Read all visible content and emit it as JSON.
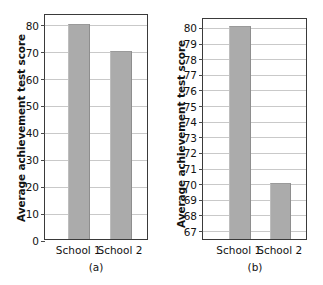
{
  "figure": {
    "panels": [
      {
        "key": "a",
        "caption": "(a)",
        "ylabel": "Average achievement test score",
        "xlabels": [
          "School 1",
          "School 2"
        ]
      },
      {
        "key": "b",
        "caption": "(b)",
        "ylabel": "Average achievement test score",
        "xlabels": [
          "School 1",
          "School 2"
        ]
      }
    ],
    "colors": {
      "bar_fill": "#ababab",
      "bar_edge_right": "#8e8e8e",
      "bar_edge_top": "#9a9a9a",
      "frame": "#3a3a3a",
      "gridline": "#c9c9c9",
      "text": "#121212",
      "background": "#ffffff"
    }
  },
  "chart_data": [
    {
      "type": "bar",
      "panel": "a",
      "title": "",
      "caption": "(a)",
      "xlabel": "",
      "ylabel": "Average achievement test score",
      "categories": [
        "School 1",
        "School 2"
      ],
      "values": [
        80,
        70
      ],
      "ylim": [
        0,
        84
      ],
      "yticks": [
        0,
        10,
        20,
        30,
        40,
        50,
        60,
        70,
        80
      ],
      "ytick_labels": [
        "0",
        "10",
        "20",
        "30",
        "40",
        "50",
        "60",
        "70",
        "80"
      ],
      "ytick_step": 10,
      "grid": true,
      "grid_axis": "y",
      "legend": false,
      "legend_position": "none",
      "bar_color": "#ababab",
      "note": "Full y-axis starting at zero; the two schools look nearly the same."
    },
    {
      "type": "bar",
      "panel": "b",
      "title": "",
      "caption": "(b)",
      "xlabel": "",
      "ylabel": "Average achievement test score",
      "categories": [
        "School 1",
        "School 2"
      ],
      "values": [
        80,
        70
      ],
      "ylim": [
        66.4,
        80.6
      ],
      "yticks": [
        67,
        68,
        69,
        70,
        71,
        72,
        73,
        74,
        75,
        76,
        77,
        78,
        79,
        80
      ],
      "ytick_labels": [
        "67",
        "68",
        "69",
        "70",
        "71",
        "72",
        "73",
        "74",
        "75",
        "76",
        "77",
        "78",
        "79",
        "80"
      ],
      "ytick_step": 1,
      "grid": true,
      "grid_axis": "y",
      "legend": false,
      "legend_position": "none",
      "bar_color": "#ababab",
      "note": "Truncated y-axis starting at 67 exaggerates the difference between schools."
    }
  ]
}
